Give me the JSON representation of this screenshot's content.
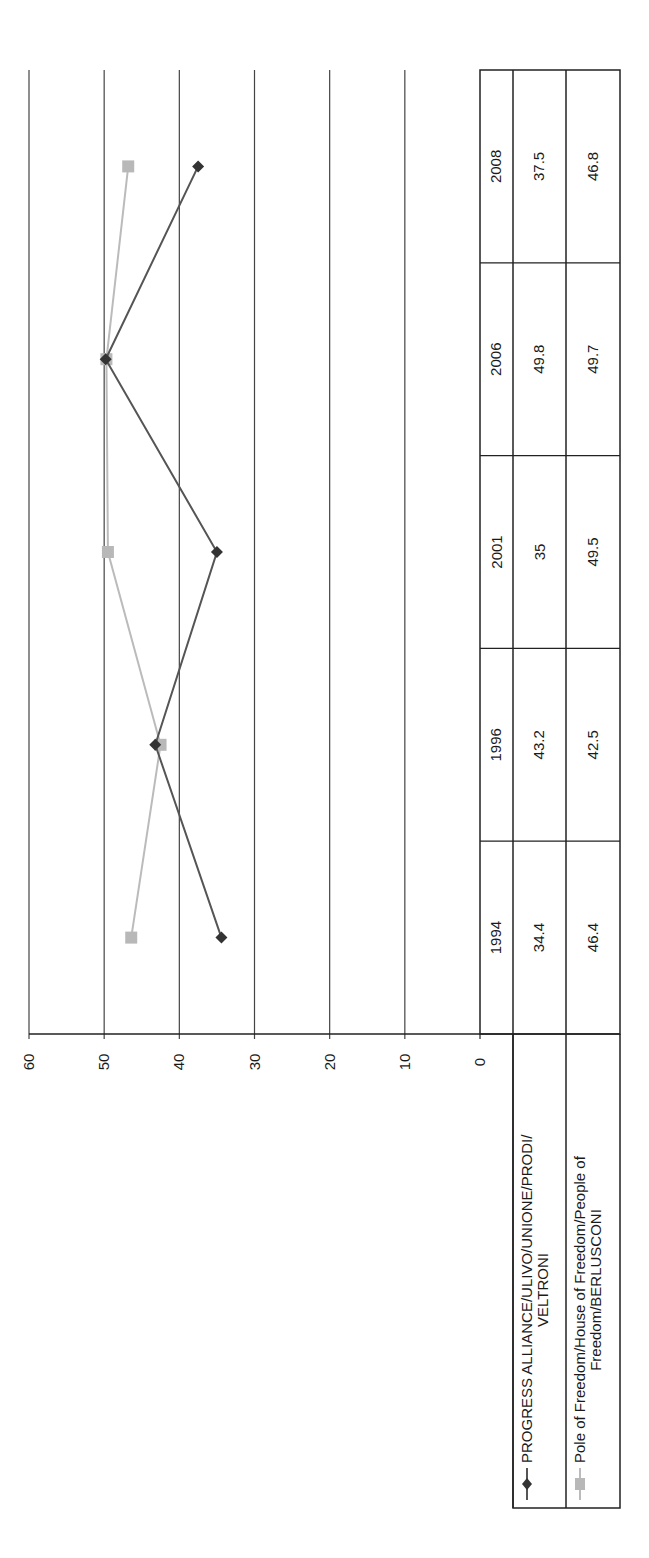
{
  "chart_data": {
    "type": "line",
    "orientation": "rotated 90deg counter-clockwise (page turned sideways)",
    "title": "",
    "xlabel": "",
    "ylabel": "",
    "categories": [
      "1994",
      "1996",
      "2001",
      "2006",
      "2008"
    ],
    "series": [
      {
        "name": "PROGRESS ALLIANCE/ULIVO/UNIONE/PRODI/VELTRONI",
        "legend_lines": [
          "PROGRESS ALLIANCE/ULIVO/UNIONE/PRODI/",
          "VELTRONI"
        ],
        "values": [
          34.4,
          43.2,
          35,
          49.8,
          37.5
        ],
        "value_labels": [
          "34.4",
          "43.2",
          "35",
          "49.8",
          "37.5"
        ],
        "color": "#555555",
        "marker": "diamond",
        "marker_color": "#333333"
      },
      {
        "name": "Pole of Freedom/House of Freedom/People of Freedom/BERLUSCONI",
        "legend_lines": [
          "Pole of Freedom/House of Freedom/People of",
          "Freedom/BERLUSCONI"
        ],
        "values": [
          46.4,
          42.5,
          49.5,
          49.7,
          46.8
        ],
        "value_labels": [
          "46.4",
          "42.5",
          "49.5",
          "49.7",
          "46.8"
        ],
        "color": "#bbbbbb",
        "marker": "square",
        "marker_color": "#b8b8b8"
      }
    ],
    "ylim": [
      0,
      60
    ],
    "yticks": [
      "0",
      "10",
      "20",
      "30",
      "40",
      "50",
      "60"
    ],
    "grid": true,
    "legend_position": "data table below plot (legend keys in table)",
    "data_table": true
  }
}
